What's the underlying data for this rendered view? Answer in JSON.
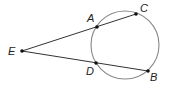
{
  "diagram": {
    "type": "circle-two-secants",
    "colors": {
      "line": "#333333",
      "circle": "#888888",
      "point": "#111111",
      "label": "#222222"
    },
    "circle": {
      "cx": 125,
      "cy": 45,
      "r": 34
    },
    "points": [
      {
        "id": "E",
        "label": "E",
        "x": 22,
        "y": 51,
        "lx": 8,
        "ly": 55
      },
      {
        "id": "A",
        "label": "A",
        "x": 97,
        "y": 27,
        "lx": 87,
        "ly": 22
      },
      {
        "id": "C",
        "label": "C",
        "x": 136,
        "y": 14,
        "lx": 140,
        "ly": 12
      },
      {
        "id": "D",
        "label": "D",
        "x": 96,
        "y": 63,
        "lx": 86,
        "ly": 75
      },
      {
        "id": "B",
        "label": "B",
        "x": 148,
        "y": 71,
        "lx": 150,
        "ly": 81
      }
    ],
    "segments": [
      {
        "from": "E",
        "to": "C"
      },
      {
        "from": "E",
        "to": "B"
      }
    ]
  }
}
